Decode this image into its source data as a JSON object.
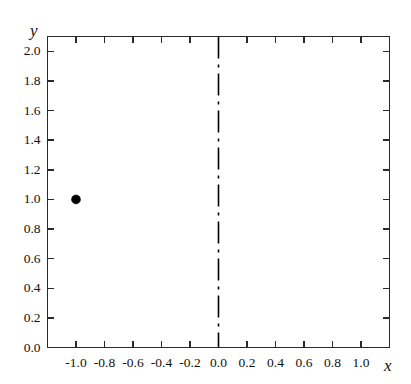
{
  "chart_data": {
    "type": "scatter",
    "title": "",
    "subtitle": "",
    "xlabel": "x",
    "ylabel": "y",
    "xlim": [
      -1.2,
      1.2
    ],
    "ylim": [
      0.0,
      2.1
    ],
    "grid": false,
    "legend": null,
    "x_ticks": [
      -1.0,
      -0.8,
      -0.6,
      -0.4,
      -0.2,
      0.0,
      0.2,
      0.4,
      0.6,
      0.8,
      1.0
    ],
    "x_tick_labels": [
      "-1.0",
      "-0.8",
      "-0.6",
      "-0.4",
      "-0.2",
      "0.0",
      "0.2",
      "0.4",
      "0.6",
      "0.8",
      "1.0"
    ],
    "y_ticks": [
      0.0,
      0.2,
      0.4,
      0.6,
      0.8,
      1.0,
      1.2,
      1.4,
      1.6,
      1.8,
      2.0
    ],
    "y_tick_labels": [
      "0.0",
      "0.2",
      "0.4",
      "0.6",
      "0.8",
      "1.0",
      "1.2",
      "1.4",
      "1.6",
      "1.8",
      "2.0"
    ],
    "series": [
      {
        "name": "data-point",
        "marker": "filled-circle",
        "color": "#000000",
        "marker_size": 9,
        "points": [
          {
            "x": -1.0,
            "y": 1.0
          }
        ]
      }
    ],
    "annotations": [
      {
        "type": "vertical-line",
        "name": "x-zero-dashdot-line",
        "x": 0.0,
        "style": "dash-dot",
        "color": "#000000",
        "width": 1.6
      }
    ],
    "axes_style": {
      "frame": "full-box",
      "tick_direction": "in",
      "frame_color": "#2a2a2a",
      "frame_width": 1.8,
      "tick_color": "#2a2a2a",
      "background": "#ffffff"
    }
  },
  "labels": {
    "x_axis_name": "x",
    "y_axis_name": "y"
  }
}
